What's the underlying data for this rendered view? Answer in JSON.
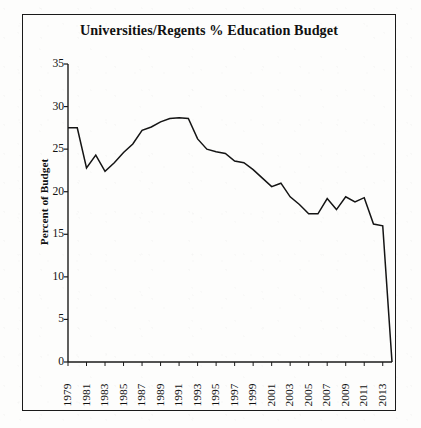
{
  "chart_data": {
    "type": "line",
    "title": "Universities/Regents % Education Budget",
    "xlabel": "",
    "ylabel": "Percent of Budget",
    "ylim": [
      0,
      35
    ],
    "xlim": [
      1979,
      2014
    ],
    "ytick_values": [
      0,
      5,
      10,
      15,
      20,
      25,
      30,
      35
    ],
    "ytick_labels": [
      "0",
      "5",
      "10",
      "15",
      "20",
      "25",
      "30",
      "35"
    ],
    "xtick_labels": [
      "1979",
      "1981",
      "1983",
      "1985",
      "1987",
      "1989",
      "1991",
      "1993",
      "1995",
      "1997",
      "1999",
      "2001",
      "2003",
      "2005",
      "2007",
      "2009",
      "2011",
      "2013"
    ],
    "xtick_values": [
      1979,
      1981,
      1983,
      1985,
      1987,
      1989,
      1991,
      1993,
      1995,
      1997,
      1999,
      2001,
      2003,
      2005,
      2007,
      2009,
      2011,
      2013
    ],
    "grid": false,
    "legend": null,
    "line_color": "#141414",
    "line_width": 1.5,
    "x": [
      1979,
      1980,
      1981,
      1982,
      1983,
      1984,
      1985,
      1986,
      1987,
      1988,
      1989,
      1990,
      1991,
      1992,
      1993,
      1994,
      1995,
      1996,
      1997,
      1998,
      1999,
      2000,
      2001,
      2002,
      2003,
      2004,
      2005,
      2006,
      2007,
      2008,
      2009,
      2010,
      2011,
      2012,
      2013,
      2014
    ],
    "values": [
      27.5,
      27.5,
      22.8,
      24.3,
      22.4,
      23.4,
      24.6,
      25.6,
      27.2,
      27.6,
      28.2,
      28.6,
      28.7,
      28.6,
      26.2,
      25.0,
      24.7,
      24.5,
      23.6,
      23.4,
      22.6,
      21.6,
      20.6,
      21.0,
      19.4,
      18.5,
      17.4,
      17.4,
      19.2,
      17.9,
      19.4,
      18.8,
      19.3,
      16.2,
      16.0,
      0.0
    ],
    "series_name": "Universities/Regents % Education Budget"
  },
  "figure": {
    "background_color": "#fdfdfc",
    "border_color": "#1a1a1a",
    "axis_color": "#1a1a1a"
  }
}
